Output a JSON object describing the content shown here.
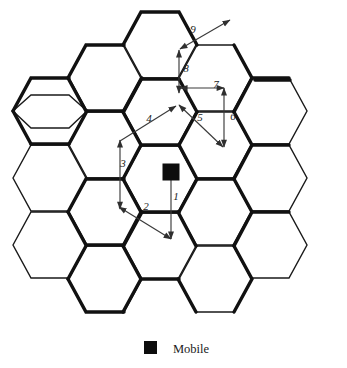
{
  "figure": {
    "title": "",
    "legend": {
      "marker_icon": "filled-square-icon",
      "label": "Mobile",
      "marker_color": "#0d0d0d"
    },
    "mobile_marker": {
      "icon": "filled-square-icon",
      "color": "#0d0d0d",
      "x": 171,
      "y": 172
    },
    "colors": {
      "thin_line": "#1a1a1a",
      "thick_line": "#111111",
      "arrow": "#3a3a3a",
      "background": "#ffffff"
    },
    "grid": {
      "shape": "hexagon",
      "orientation": "flat-top",
      "columns": 5,
      "cell_count": 19,
      "hex_width": 74,
      "hex_height": 67
    },
    "arrows": [
      {
        "label": "1",
        "label_x": 176,
        "label_y": 200,
        "heads": "end",
        "x1": 171,
        "y1": 178,
        "x2": 171,
        "y2": 239
      },
      {
        "label": "2",
        "label_x": 146,
        "label_y": 210,
        "heads": "both",
        "x1": 171,
        "y1": 239,
        "x2": 119,
        "y2": 207
      },
      {
        "label": "3",
        "label_x": 123,
        "label_y": 167,
        "heads": "both",
        "x1": 120,
        "y1": 209,
        "x2": 120,
        "y2": 140
      },
      {
        "label": "4",
        "label_x": 149,
        "label_y": 122,
        "heads": "end",
        "x1": 120,
        "y1": 141,
        "x2": 176,
        "y2": 106
      },
      {
        "label": "5",
        "label_x": 200,
        "label_y": 121,
        "heads": "both",
        "x1": 179,
        "y1": 105,
        "x2": 223,
        "y2": 147
      },
      {
        "label": "6",
        "label_x": 233,
        "label_y": 120,
        "heads": "both",
        "x1": 224,
        "y1": 147,
        "x2": 224,
        "y2": 88
      },
      {
        "label": "7",
        "label_x": 216,
        "label_y": 88,
        "heads": "both",
        "x1": 224,
        "y1": 88,
        "x2": 180,
        "y2": 88
      },
      {
        "label": "8",
        "label_x": 186,
        "label_y": 72,
        "heads": "both",
        "x1": 179,
        "y1": 93,
        "x2": 179,
        "y2": 50
      },
      {
        "label": "9",
        "label_x": 193,
        "label_y": 33,
        "heads": "both",
        "x1": 180,
        "y1": 49,
        "x2": 230,
        "y2": 20
      }
    ],
    "hexagons": [
      {
        "cx": 50,
        "cy": 111
      },
      {
        "cx": 50,
        "cy": 178
      },
      {
        "cx": 50,
        "cy": 245
      },
      {
        "cx": 105,
        "cy": 78
      },
      {
        "cx": 105,
        "cy": 145
      },
      {
        "cx": 105,
        "cy": 212
      },
      {
        "cx": 105,
        "cy": 279
      },
      {
        "cx": 160,
        "cy": 45
      },
      {
        "cx": 160,
        "cy": 112
      },
      {
        "cx": 160,
        "cy": 179
      },
      {
        "cx": 160,
        "cy": 246
      },
      {
        "cx": 215,
        "cy": 78
      },
      {
        "cx": 215,
        "cy": 145
      },
      {
        "cx": 215,
        "cy": 212
      },
      {
        "cx": 215,
        "cy": 279
      },
      {
        "cx": 270,
        "cy": 111
      },
      {
        "cx": 270,
        "cy": 178
      },
      {
        "cx": 270,
        "cy": 245
      },
      {
        "cx": 160,
        "cy": 45
      }
    ]
  }
}
